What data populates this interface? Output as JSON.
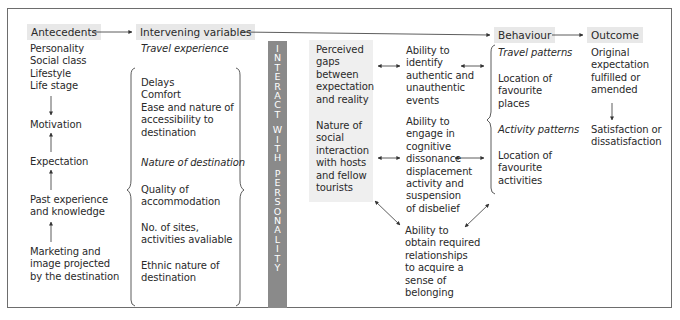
{
  "headers": {
    "antecedents": "Antecedents",
    "intervening": "Intervening variables",
    "behaviour": "Behaviour",
    "outcome": "Outcome"
  },
  "antecedents": {
    "factors": [
      "Personality",
      "Social class",
      "Lifestyle",
      "Life stage"
    ],
    "motivation": "Motivation",
    "expectation": "Expectation",
    "past_experience": [
      "Past experience",
      "and knowledge"
    ],
    "marketing": [
      "Marketing and",
      "image projected",
      "by the destination"
    ]
  },
  "intervening": {
    "travel_experience_title": "Travel experience",
    "travel_experience_items": [
      "Delays",
      "Comfort",
      "Ease and nature of",
      "accessibility to",
      "destination"
    ],
    "nature_title": "Nature of destination",
    "quality": [
      "Quality of",
      "accommodation"
    ],
    "sites": [
      "No. of sites,",
      "activities avaliable"
    ],
    "ethnic": [
      "Ethnic nature of",
      "destination"
    ]
  },
  "interact_bar": [
    "I",
    "N",
    "T",
    "E",
    "R",
    "A",
    "C",
    "T",
    "",
    "W",
    "I",
    "T",
    "H",
    "",
    "P",
    "E",
    "R",
    "S",
    "O",
    "N",
    "A",
    "L",
    "I",
    "T",
    "Y"
  ],
  "perceived": {
    "gaps": [
      "Perceived",
      "gaps",
      "between",
      "expectation",
      "and reality"
    ],
    "social": [
      "Nature of",
      "social",
      "interaction",
      "with hosts",
      "and fellow",
      "tourists"
    ]
  },
  "abilities": {
    "identify": [
      "Ability to",
      "identify",
      "authentic and",
      "unauthentic",
      "events"
    ],
    "engage": [
      "Ability to",
      "engage in",
      "cognitive",
      "dissonance",
      "displacement",
      "activity and",
      "suspension",
      "of disbelief"
    ],
    "obtain": [
      "Ability to",
      "obtain required",
      "relationships",
      "to acquire a",
      "sense of",
      "belonging"
    ]
  },
  "behaviour": {
    "travel_patterns_title": "Travel patterns",
    "travel_patterns": [
      "Location of",
      "favourite",
      "places"
    ],
    "activity_patterns_title": "Activity patterns",
    "activity_patterns": [
      "Location of",
      "favourite",
      "activities"
    ]
  },
  "outcome": {
    "original": [
      "Original",
      "expectation",
      "fulfilled or",
      "amended"
    ],
    "satisfaction": [
      "Satisfaction or",
      "dissatisfaction"
    ]
  },
  "colors": {
    "header_bg": "#e8e8e8",
    "bar_bg": "#8a8a8a",
    "box_bg": "#efefef",
    "line": "#333333"
  }
}
